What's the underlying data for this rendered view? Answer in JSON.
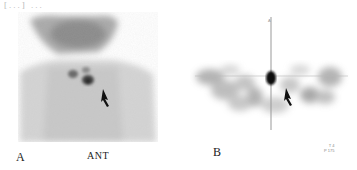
{
  "header_fragment": "[...] ...",
  "figure": {
    "panels": [
      {
        "id": "A",
        "label": "A",
        "caption": "ANT",
        "description": "Anterior planar scintigraphy of neck and chest with focal uptake; arrow points to lesion"
      },
      {
        "id": "B",
        "label": "B",
        "description": "Transaxial SPECT slice with crosshair; central hot spot and arrow pointing to lesion",
        "crosshair_marker": "A",
        "overlay_text": [
          "T 4",
          "P 175"
        ]
      }
    ]
  },
  "colors": {
    "background": "#ffffff",
    "uptake_dark": "#1a1a1a",
    "background_gray": "#d0d0d0"
  }
}
